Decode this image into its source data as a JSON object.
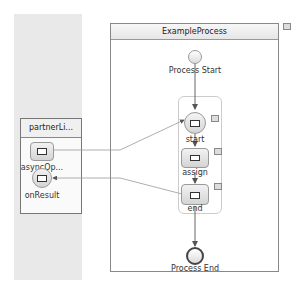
{
  "process": {
    "title": "ExampleProcess",
    "start_label": "Process Start",
    "end_label": "Process End",
    "activities": [
      {
        "name": "start",
        "type": "receive",
        "icon": "envelope-icon"
      },
      {
        "name": "assign",
        "type": "assign",
        "icon": "assign-icon"
      },
      {
        "name": "end",
        "type": "reply",
        "icon": "envelope-icon"
      }
    ]
  },
  "partner_link": {
    "title": "partnerLi...",
    "operations": [
      {
        "name": "asyncOp...",
        "icon": "envelope-icon"
      },
      {
        "name": "onResult",
        "icon": "envelope-icon"
      }
    ]
  },
  "colors": {
    "lane_bg": "#e9e9e9",
    "border": "#888888",
    "connector": "#666666"
  }
}
